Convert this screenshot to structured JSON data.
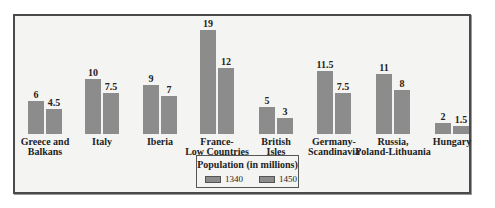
{
  "chart_data": {
    "type": "bar",
    "title": "Population (in millions)",
    "xlabel": "",
    "ylabel": "",
    "ylim": [
      0,
      20
    ],
    "grid": false,
    "legend_position": "bottom-center",
    "categories": [
      "Greece and Balkans",
      "Italy",
      "Iberia",
      "France-Low Countries",
      "British Isles",
      "Germany-Scandinavia",
      "Russia, Poland-Lithuania",
      "Hungary"
    ],
    "category_lines": [
      [
        "Greece and",
        "Balkans"
      ],
      [
        "Italy"
      ],
      [
        "Iberia"
      ],
      [
        "France-",
        "Low Countries"
      ],
      [
        "British",
        "Isles"
      ],
      [
        "Germany-",
        "Scandinavia"
      ],
      [
        "Russia,",
        "Poland-Lithuania"
      ],
      [
        "Hungary"
      ]
    ],
    "series": [
      {
        "name": "1340",
        "values": [
          6,
          10,
          9,
          19,
          5,
          11.5,
          11,
          2
        ],
        "labels": [
          "6",
          "10",
          "9",
          "19",
          "5",
          "11.5",
          "11",
          "2"
        ]
      },
      {
        "name": "1450",
        "values": [
          4.5,
          7.5,
          7,
          12,
          3,
          7.5,
          8,
          1.5
        ],
        "labels": [
          "4.5",
          "7.5",
          "7",
          "12",
          "3",
          "7.5",
          "8",
          "1.5"
        ]
      }
    ],
    "colors": {
      "bar": "#8c8c8c",
      "background": "#f4f4f2",
      "frame": "#4a4a4a"
    }
  },
  "legend": {
    "title": "Population (in millions)",
    "items": [
      {
        "label": "1340"
      },
      {
        "label": "1450"
      }
    ]
  }
}
